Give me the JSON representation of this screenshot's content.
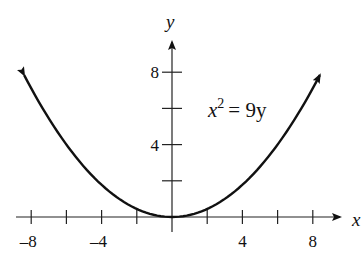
{
  "chart_data": {
    "type": "line",
    "title": "",
    "equation": "x^2 = 9y",
    "equation_base": "x",
    "equation_exp": "2",
    "equation_rhs": "= 9y",
    "xlabel": "x",
    "ylabel": "y",
    "xlim": [
      -9,
      9
    ],
    "ylim": [
      0,
      9
    ],
    "x_ticks": [
      -8,
      -6,
      -4,
      -2,
      2,
      4,
      6,
      8
    ],
    "x_tick_labels": [
      "-8",
      "-4",
      "4",
      "8"
    ],
    "y_ticks": [
      2,
      4,
      6,
      8
    ],
    "y_tick_labels": [
      "4",
      "8"
    ],
    "grid": false,
    "series": [
      {
        "name": "x^2 = 9y",
        "x": [
          -8.4,
          -8,
          -6,
          -4,
          -2,
          0,
          2,
          4,
          6,
          8,
          8.4
        ],
        "y": [
          7.84,
          7.11,
          4,
          1.78,
          0.44,
          0,
          0.44,
          1.78,
          4,
          7.11,
          7.84
        ],
        "arrows_at_ends": true
      }
    ]
  }
}
